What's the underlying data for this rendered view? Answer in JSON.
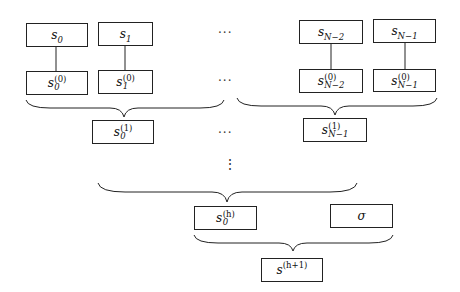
{
  "diagram": {
    "type": "tree-aggregation",
    "leaves": [
      {
        "id": "s0",
        "base": "s",
        "sub": "0"
      },
      {
        "id": "s1",
        "base": "s",
        "sub": "1"
      },
      {
        "id": "sN-2",
        "base": "s",
        "sub": "N−2"
      },
      {
        "id": "sN-1",
        "base": "s",
        "sub": "N−1"
      }
    ],
    "level0": [
      {
        "id": "s0_0",
        "base": "s",
        "sup": "(0)",
        "sub": "0"
      },
      {
        "id": "s1_0",
        "base": "s",
        "sup": "(0)",
        "sub": "1"
      },
      {
        "id": "sN-2_0",
        "base": "s",
        "sup": "(0)",
        "sub": "N−2"
      },
      {
        "id": "sN-1_0",
        "base": "s",
        "sup": "(0)",
        "sub": "N−1"
      }
    ],
    "level1": [
      {
        "id": "s0_1",
        "base": "s",
        "sup": "(1)",
        "sub": "0"
      },
      {
        "id": "sN-1_1",
        "base": "s",
        "sup": "(1)",
        "sub": "N−1"
      }
    ],
    "levelh": {
      "id": "s0_h",
      "base": "s",
      "sup": "(h)",
      "sub": "0"
    },
    "sigma": {
      "id": "sigma",
      "label": "σ"
    },
    "root": {
      "id": "s_h1",
      "base": "s",
      "sup": "(h+1)"
    },
    "ellipsis_h": "···",
    "ellipsis_v": "⋮"
  }
}
